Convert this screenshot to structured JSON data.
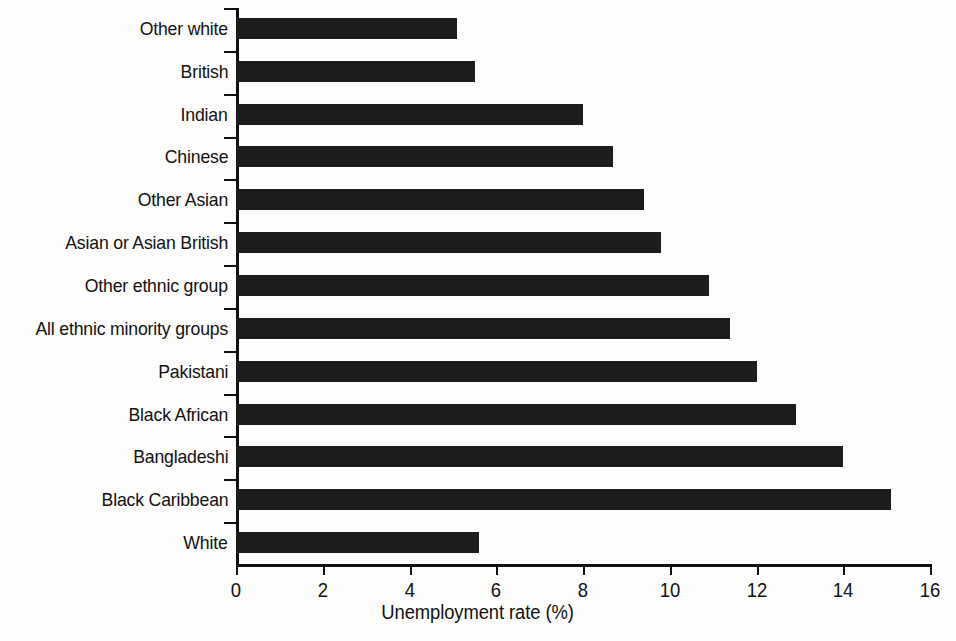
{
  "chart_data": {
    "type": "bar",
    "orientation": "horizontal",
    "title": "",
    "xlabel": "Unemployment rate (%)",
    "ylabel": "",
    "xlim": [
      0,
      16
    ],
    "xticks": [
      0,
      2,
      4,
      6,
      8,
      10,
      12,
      14,
      16
    ],
    "xtick_labels": [
      "0",
      "2",
      "4",
      "6",
      "8",
      "10",
      "12",
      "14",
      "16"
    ],
    "grid": false,
    "legend": false,
    "bar_color": "#1c1c1c",
    "background_color": "#fdfdfc",
    "axis_color": "#111111",
    "categories": [
      "Other white",
      "British",
      "Indian",
      "Chinese",
      "Other Asian",
      "Asian or Asian British",
      "Other ethnic group",
      "All ethnic minority groups",
      "Pakistani",
      "Black African",
      "Bangladeshi",
      "Black Caribbean",
      "White"
    ],
    "values": [
      5.1,
      5.5,
      8.0,
      8.7,
      9.4,
      9.8,
      10.9,
      11.4,
      12.0,
      12.9,
      14.0,
      15.1,
      5.6
    ]
  }
}
